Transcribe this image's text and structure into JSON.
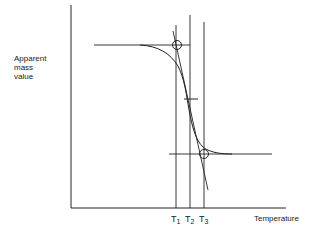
{
  "diagram": {
    "type": "thermogravimetric-curve-schematic",
    "y_axis_label_lines": [
      "Apparent",
      "mass",
      "value"
    ],
    "x_axis_label": "Temperature",
    "temperature_markers": [
      {
        "symbol": "T",
        "subscript": "1"
      },
      {
        "symbol": "T",
        "subscript": "2"
      },
      {
        "symbol": "T",
        "subscript": "3"
      }
    ],
    "colors": {
      "line": "#222222",
      "background": "#ffffff"
    }
  }
}
